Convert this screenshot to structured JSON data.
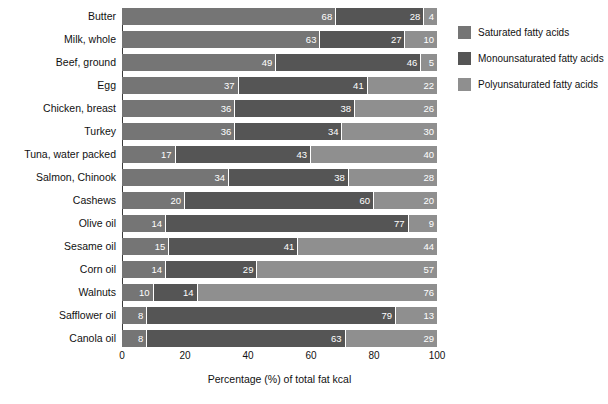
{
  "chart_data": {
    "type": "bar",
    "orientation": "horizontal",
    "stacked": true,
    "title": "",
    "xlabel": "Percentage (%) of total fat kcal",
    "ylabel": "",
    "xlim": [
      0,
      100
    ],
    "xticks": [
      0,
      20,
      40,
      60,
      80,
      100
    ],
    "xtick_labels": [
      "0",
      "20",
      "40",
      "60",
      "80",
      "100"
    ],
    "grid": false,
    "legend_position": "right",
    "categories": [
      "Butter",
      "Milk, whole",
      "Beef, ground",
      "Egg",
      "Chicken, breast",
      "Turkey",
      "Tuna, water packed",
      "Salmon, Chinook",
      "Cashews",
      "Olive oil",
      "Sesame oil",
      "Corn oil",
      "Walnuts",
      "Safflower oil",
      "Canola oil"
    ],
    "series": [
      {
        "name": "Saturated fatty acids",
        "color": "#757575",
        "values": [
          68,
          63,
          49,
          37,
          36,
          36,
          17,
          34,
          20,
          14,
          15,
          14,
          10,
          8,
          8
        ]
      },
      {
        "name": "Monounsaturated fatty acids",
        "color": "#555555",
        "values": [
          28,
          27,
          46,
          41,
          38,
          34,
          43,
          38,
          60,
          77,
          41,
          29,
          14,
          79,
          63
        ]
      },
      {
        "name": "Polyunsaturated fatty acids",
        "color": "#8f8f8f",
        "values": [
          4,
          10,
          5,
          22,
          26,
          30,
          40,
          28,
          20,
          9,
          44,
          57,
          76,
          13,
          29
        ]
      }
    ]
  },
  "legend": {
    "items": [
      {
        "label": "Saturated fatty acids",
        "swatch": "sat"
      },
      {
        "label": "Monounsaturated fatty acids",
        "swatch": "mono"
      },
      {
        "label": "Polyunsaturated fatty acids",
        "swatch": "poly"
      }
    ]
  }
}
